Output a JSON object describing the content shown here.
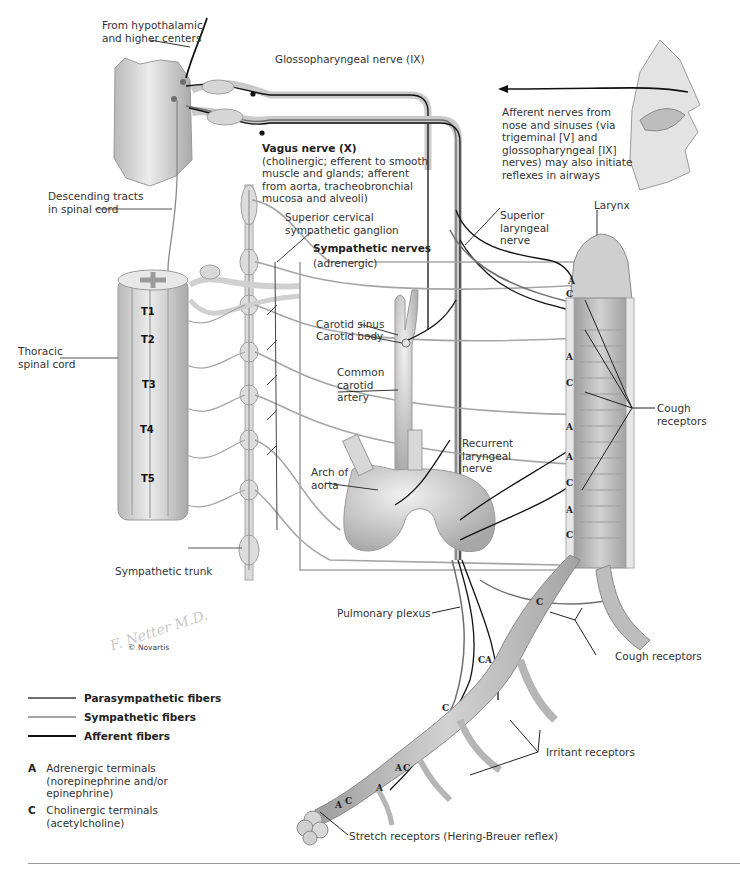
{
  "figure": {
    "copyright": "© Novartis",
    "signature": "F. Netter M.D."
  },
  "labels": {
    "hypothalamic": [
      "From hypothalamic",
      "and higher centers"
    ],
    "glossopharyngeal": "Glossopharyngeal nerve (IX)",
    "vagus_title": "Vagus nerve (X)",
    "vagus_desc": [
      "(cholinergic; efferent to smooth",
      "muscle and glands; afferent",
      "from aorta, tracheobronchial",
      "mucosa and alveoli)"
    ],
    "nose": [
      "Afferent nerves from",
      "nose and sinuses (via",
      "trigeminal [V] and",
      "glossopharyngeal [IX]",
      "nerves) may also initiate",
      "reflexes in airways"
    ],
    "descending": [
      "Descending tracts",
      "in spinal cord"
    ],
    "superior_cervical": [
      "Superior cervical",
      "sympathetic ganglion"
    ],
    "sympathetic_nerves_title": "Sympathetic nerves",
    "sympathetic_nerves_sub": "(adrenergic)",
    "superior_laryngeal": [
      "Superior",
      "laryngeal",
      "nerve"
    ],
    "larynx": "Larynx",
    "carotid_sinus": "Carotid sinus",
    "carotid_body": "Carotid body",
    "thoracic": [
      "Thoracic",
      "spinal cord"
    ],
    "common_carotid": [
      "Common",
      "carotid",
      "artery"
    ],
    "cough_receptors_upper": [
      "Cough",
      "receptors"
    ],
    "recurrent_laryngeal": [
      "Recurrent",
      "laryngeal",
      "nerve"
    ],
    "arch_aorta": [
      "Arch of",
      "aorta"
    ],
    "sympathetic_trunk": "Sympathetic trunk",
    "pulmonary_plexus": "Pulmonary plexus",
    "cough_receptors_lower": "Cough receptors",
    "irritant_receptors": "Irritant receptors",
    "stretch_receptors": "Stretch receptors (Hering-Breuer reflex)"
  },
  "spinal_segments": [
    "T1",
    "T2",
    "T3",
    "T4",
    "T5"
  ],
  "terminal_markers": {
    "trachea": [
      "A",
      "C",
      "A",
      "C",
      "A",
      "A",
      "C",
      "A",
      "C"
    ],
    "bronchi": [
      "C",
      "C",
      "A",
      "C",
      "A",
      "C",
      "A",
      "C",
      "A"
    ]
  },
  "legend": {
    "fibers": [
      {
        "label": "Parasympathetic fibers",
        "color": "#6e6e6e",
        "width": 2
      },
      {
        "label": "Sympathetic fibers",
        "color": "#a5a5a5",
        "width": 2
      },
      {
        "label": "Afferent fibers",
        "color": "#111111",
        "width": 2.5
      }
    ],
    "terminals": [
      {
        "letter": "A",
        "lines": [
          "Adrenergic terminals",
          "(norepinephrine and/or",
          "epinephrine)"
        ]
      },
      {
        "letter": "C",
        "lines": [
          "Cholinergic terminals",
          "(acetylcholine)"
        ]
      }
    ]
  },
  "colors": {
    "parasympathetic": "#6e6e6e",
    "sympathetic": "#a5a5a5",
    "afferent": "#111111",
    "tissue": "#d9d9d9",
    "tissue_dark": "#b5b5b5",
    "rule": "#9a9a9a"
  }
}
